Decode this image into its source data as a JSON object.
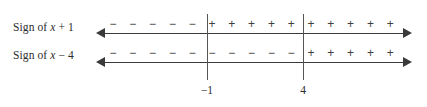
{
  "figure": {
    "background_color": "#ffffff",
    "line_color": "#3a3a3a",
    "divider_color": "#555555",
    "text_color": "#2b2b2b",
    "sign_color": "#3f3f3f"
  },
  "rows": [
    {
      "label_prefix": "Sign of ",
      "label_variable": "x",
      "label_suffix": " + 1",
      "label_full": "Sign of x + 1",
      "signs": [
        "−",
        "−",
        "−",
        "−",
        "−",
        "+",
        "+",
        "+",
        "+",
        "+",
        "+",
        "+",
        "+",
        "+",
        "+"
      ]
    },
    {
      "label_prefix": "Sign of ",
      "label_variable": "x",
      "label_suffix": " − 4",
      "label_full": "Sign of x - 4",
      "signs": [
        "−",
        "−",
        "−",
        "−",
        "−",
        "−",
        "−",
        "−",
        "−",
        "−",
        "+",
        "+",
        "+",
        "+",
        "+"
      ]
    }
  ],
  "critical_points": [
    {
      "label": "−1",
      "value": -1,
      "x": 207
    },
    {
      "label": "4",
      "value": 4,
      "x": 303
    }
  ],
  "chart_data": {
    "type": "table",
    "categories": [
      "x < −1",
      "−1 < x < 4",
      "x > 4"
    ],
    "series": [
      {
        "name": "Sign of x + 1",
        "values": [
          "−",
          "+",
          "+"
        ]
      },
      {
        "name": "Sign of x − 4",
        "values": [
          "−",
          "−",
          "+"
        ]
      }
    ],
    "critical_points": [
      -1,
      4
    ],
    "xlabel": "",
    "ylabel": "",
    "grid": false,
    "legend": "none"
  },
  "geometry": {
    "axis_left": 96,
    "axis_right": 412,
    "sign_start_x": 113,
    "sign_spacing": 19.8,
    "rows_y": [
      33,
      62
    ]
  }
}
